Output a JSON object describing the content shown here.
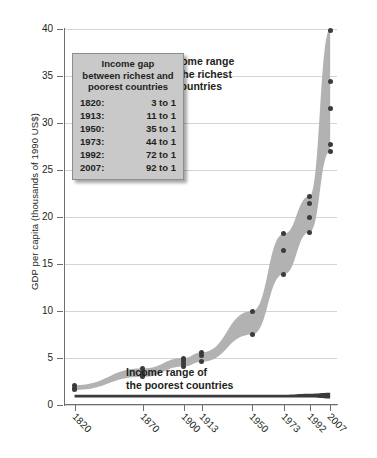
{
  "chart_data": {
    "type": "area",
    "title": "",
    "xlabel": "",
    "ylabel": "GDP per capita (thousands of 1990 US$)",
    "ylim": [
      0,
      40
    ],
    "yticks": [
      0,
      5,
      10,
      15,
      20,
      25,
      30,
      35,
      40
    ],
    "ytick_labels": [
      "0",
      "5",
      "10",
      "15",
      "20",
      "25",
      "30",
      "35",
      "40"
    ],
    "grid": true,
    "legend_position": "none",
    "x": [
      1820,
      1870,
      1900,
      1913,
      1950,
      1973,
      1992,
      2007
    ],
    "xtick_labels": [
      "1820",
      "1870",
      "1900",
      "1913",
      "1950",
      "1973",
      "1992",
      "2007"
    ],
    "xlim": [
      1813,
      2012
    ],
    "series": [
      {
        "name": "Income range of the richest 5 countries",
        "kind": "band",
        "upper": [
          2.1,
          3.9,
          5.0,
          5.6,
          10.0,
          18.2,
          22.2,
          40.0
        ],
        "lower": [
          1.6,
          3.0,
          4.1,
          4.6,
          7.5,
          13.9,
          18.4,
          27.0
        ],
        "color": "#b2b2b2"
      },
      {
        "name": "Income range of the poorest countries",
        "kind": "band",
        "upper": [
          1.1,
          1.1,
          1.1,
          1.1,
          1.1,
          1.1,
          1.2,
          1.3
        ],
        "lower": [
          0.8,
          0.8,
          0.8,
          0.8,
          0.8,
          0.8,
          0.8,
          0.7
        ],
        "color": "#3b3b3b"
      }
    ],
    "points": [
      {
        "x": 1820,
        "y": 2.1
      },
      {
        "x": 1820,
        "y": 1.8
      },
      {
        "x": 1820,
        "y": 1.6
      },
      {
        "x": 1870,
        "y": 3.9
      },
      {
        "x": 1870,
        "y": 3.5
      },
      {
        "x": 1870,
        "y": 3.2
      },
      {
        "x": 1870,
        "y": 3.0
      },
      {
        "x": 1900,
        "y": 5.0
      },
      {
        "x": 1900,
        "y": 4.7
      },
      {
        "x": 1900,
        "y": 4.4
      },
      {
        "x": 1900,
        "y": 4.1
      },
      {
        "x": 1913,
        "y": 5.6
      },
      {
        "x": 1913,
        "y": 5.3
      },
      {
        "x": 1913,
        "y": 4.6
      },
      {
        "x": 1950,
        "y": 10.0
      },
      {
        "x": 1950,
        "y": 7.5
      },
      {
        "x": 1973,
        "y": 18.2
      },
      {
        "x": 1973,
        "y": 16.4
      },
      {
        "x": 1973,
        "y": 13.9
      },
      {
        "x": 1992,
        "y": 22.2
      },
      {
        "x": 1992,
        "y": 21.4
      },
      {
        "x": 1992,
        "y": 19.9
      },
      {
        "x": 1992,
        "y": 18.4
      },
      {
        "x": 2007,
        "y": 39.8
      },
      {
        "x": 2007,
        "y": 34.4
      },
      {
        "x": 2007,
        "y": 31.5
      },
      {
        "x": 2007,
        "y": 27.7
      },
      {
        "x": 2007,
        "y": 27.0
      }
    ],
    "annotations": [
      {
        "name": "richest",
        "text_lines": [
          "Income range",
          "of the richest",
          "5 countries"
        ]
      },
      {
        "name": "poorest",
        "text_lines": [
          "Income range of",
          "the poorest countries"
        ]
      }
    ]
  },
  "legend_box": {
    "title_lines": [
      "Income gap",
      "between richest and",
      "poorest countries"
    ],
    "rows": [
      {
        "year": "1820:",
        "value": "3 to 1"
      },
      {
        "year": "1913:",
        "value": "11 to 1"
      },
      {
        "year": "1950:",
        "value": "35 to 1"
      },
      {
        "year": "1973:",
        "value": "44 to 1"
      },
      {
        "year": "1992:",
        "value": "72 to 1"
      },
      {
        "year": "2007:",
        "value": "92 to 1"
      }
    ]
  },
  "colors": {
    "band_rich": "#b2b2b2",
    "band_poor": "#3b3b3b",
    "dot": "#3b3b3b",
    "grid": "#d4d4d4",
    "axis": "#6d6e70",
    "legend_bg": "#c9c9c9",
    "text": "#231f20"
  }
}
